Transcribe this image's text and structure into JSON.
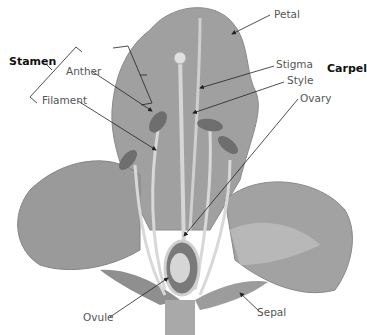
{
  "diagram": {
    "groups": [
      {
        "label": "Stamen",
        "parts": [
          "Anther",
          "Filament"
        ]
      },
      {
        "label": "Carpel",
        "parts": [
          "Stigma",
          "Style",
          "Ovary"
        ]
      }
    ],
    "labels": {
      "stamen": "Stamen",
      "carpel": "Carpel",
      "anther": "Anther",
      "filament": "Filament",
      "petal": "Petal",
      "stigma": "Stigma",
      "style": "Style",
      "ovary": "Ovary",
      "ovule": "Ovule",
      "sepal": "Sepal"
    },
    "colors": {
      "petal_dark": "#8a8a8a",
      "petal_mid": "#a8a8a8",
      "petal_light": "#c4c4c4",
      "anther": "#6e6e6e",
      "filament": "#d6d6d6",
      "label_text": "#555555",
      "leader_line": "#222222"
    }
  }
}
